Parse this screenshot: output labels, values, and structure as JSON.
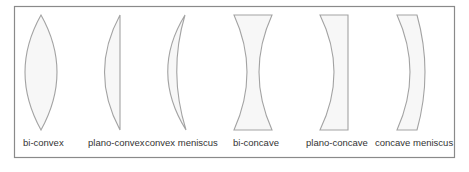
{
  "diagram": {
    "colors": {
      "frame_stroke": "#8a8a8a",
      "lens_stroke": "#a3a3a3",
      "lens_fill": "#f7f7f7",
      "label_text": "#333333"
    },
    "lenses": [
      {
        "id": "bi-convex",
        "label": "bi-convex"
      },
      {
        "id": "plano-convex",
        "label": "plano-convex"
      },
      {
        "id": "convex-meniscus",
        "label": "convex meniscus"
      },
      {
        "id": "bi-concave",
        "label": "bi-concave"
      },
      {
        "id": "plano-concave",
        "label": "plano-concave"
      },
      {
        "id": "concave-meniscus",
        "label": "concave meniscus"
      }
    ]
  }
}
